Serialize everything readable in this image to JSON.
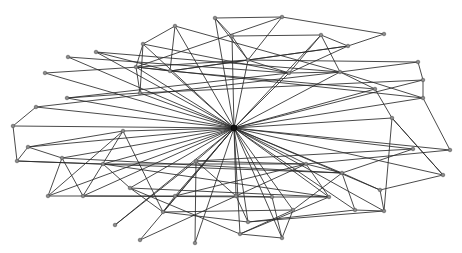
{
  "diagram": {
    "type": "network-graph",
    "background": "#ffffff",
    "edge_color": "#2a2a2a",
    "node_color": "#8a8a8a",
    "hub": "h",
    "nodes": [
      {
        "id": "h",
        "x": 234,
        "y": 128
      },
      {
        "id": "a1",
        "x": 215,
        "y": 18
      },
      {
        "id": "a2",
        "x": 282,
        "y": 17
      },
      {
        "id": "a3",
        "x": 175,
        "y": 26
      },
      {
        "id": "a4",
        "x": 143,
        "y": 44
      },
      {
        "id": "a5",
        "x": 232,
        "y": 36
      },
      {
        "id": "a6",
        "x": 321,
        "y": 35
      },
      {
        "id": "a7",
        "x": 384,
        "y": 34
      },
      {
        "id": "a8",
        "x": 348,
        "y": 46
      },
      {
        "id": "a9",
        "x": 96,
        "y": 52
      },
      {
        "id": "a10",
        "x": 68,
        "y": 57
      },
      {
        "id": "a11",
        "x": 45,
        "y": 73
      },
      {
        "id": "a12",
        "x": 136,
        "y": 67
      },
      {
        "id": "a13",
        "x": 170,
        "y": 71
      },
      {
        "id": "a14",
        "x": 140,
        "y": 93
      },
      {
        "id": "a15",
        "x": 67,
        "y": 98
      },
      {
        "id": "a16",
        "x": 36,
        "y": 107
      },
      {
        "id": "a17",
        "x": 248,
        "y": 60
      },
      {
        "id": "a18",
        "x": 289,
        "y": 73
      },
      {
        "id": "a19",
        "x": 340,
        "y": 72
      },
      {
        "id": "a20",
        "x": 418,
        "y": 62
      },
      {
        "id": "a21",
        "x": 423,
        "y": 80
      },
      {
        "id": "a22",
        "x": 423,
        "y": 98
      },
      {
        "id": "a23",
        "x": 375,
        "y": 89
      },
      {
        "id": "a24",
        "x": 392,
        "y": 118
      },
      {
        "id": "b1",
        "x": 13,
        "y": 126
      },
      {
        "id": "b2",
        "x": 123,
        "y": 131
      },
      {
        "id": "b3",
        "x": 28,
        "y": 147
      },
      {
        "id": "b4",
        "x": 17,
        "y": 161
      },
      {
        "id": "b5",
        "x": 62,
        "y": 158
      },
      {
        "id": "b6",
        "x": 103,
        "y": 164
      },
      {
        "id": "b7",
        "x": 48,
        "y": 196
      },
      {
        "id": "b8",
        "x": 83,
        "y": 196
      },
      {
        "id": "b9",
        "x": 130,
        "y": 188
      },
      {
        "id": "b10",
        "x": 163,
        "y": 212
      },
      {
        "id": "b11",
        "x": 115,
        "y": 225
      },
      {
        "id": "b12",
        "x": 140,
        "y": 240
      },
      {
        "id": "b13",
        "x": 195,
        "y": 243
      },
      {
        "id": "b14",
        "x": 196,
        "y": 161
      },
      {
        "id": "b15",
        "x": 306,
        "y": 164
      },
      {
        "id": "b16",
        "x": 342,
        "y": 173
      },
      {
        "id": "b17",
        "x": 380,
        "y": 190
      },
      {
        "id": "b18",
        "x": 384,
        "y": 211
      },
      {
        "id": "b19",
        "x": 443,
        "y": 175
      },
      {
        "id": "b20",
        "x": 450,
        "y": 150
      },
      {
        "id": "b21",
        "x": 413,
        "y": 149
      },
      {
        "id": "b22",
        "x": 329,
        "y": 197
      },
      {
        "id": "b23",
        "x": 272,
        "y": 197
      },
      {
        "id": "b24",
        "x": 236,
        "y": 196
      },
      {
        "id": "b25",
        "x": 293,
        "y": 210
      },
      {
        "id": "b26",
        "x": 248,
        "y": 222
      },
      {
        "id": "b27",
        "x": 282,
        "y": 238
      },
      {
        "id": "b28",
        "x": 240,
        "y": 234
      },
      {
        "id": "b29",
        "x": 355,
        "y": 210
      },
      {
        "id": "b30",
        "x": 175,
        "y": 196
      }
    ],
    "edges": [
      [
        "h",
        "a1"
      ],
      [
        "h",
        "a3"
      ],
      [
        "h",
        "a4"
      ],
      [
        "h",
        "a5"
      ],
      [
        "h",
        "a6"
      ],
      [
        "h",
        "a9"
      ],
      [
        "h",
        "a10"
      ],
      [
        "h",
        "a11"
      ],
      [
        "h",
        "a12"
      ],
      [
        "h",
        "a13"
      ],
      [
        "h",
        "a14"
      ],
      [
        "h",
        "a15"
      ],
      [
        "h",
        "a16"
      ],
      [
        "h",
        "a17"
      ],
      [
        "h",
        "a18"
      ],
      [
        "h",
        "a19"
      ],
      [
        "h",
        "a21"
      ],
      [
        "h",
        "a22"
      ],
      [
        "h",
        "a23"
      ],
      [
        "h",
        "a24"
      ],
      [
        "h",
        "b1"
      ],
      [
        "h",
        "b2"
      ],
      [
        "h",
        "b3"
      ],
      [
        "h",
        "b5"
      ],
      [
        "h",
        "b6"
      ],
      [
        "h",
        "b7"
      ],
      [
        "h",
        "b8"
      ],
      [
        "h",
        "b9"
      ],
      [
        "h",
        "b10"
      ],
      [
        "h",
        "b11"
      ],
      [
        "h",
        "b12"
      ],
      [
        "h",
        "b13"
      ],
      [
        "h",
        "b14"
      ],
      [
        "h",
        "b15"
      ],
      [
        "h",
        "b16"
      ],
      [
        "h",
        "b17"
      ],
      [
        "h",
        "b18"
      ],
      [
        "h",
        "b19"
      ],
      [
        "h",
        "b20"
      ],
      [
        "h",
        "b21"
      ],
      [
        "h",
        "b22"
      ],
      [
        "h",
        "b23"
      ],
      [
        "h",
        "b24"
      ],
      [
        "h",
        "b25"
      ],
      [
        "h",
        "b26"
      ],
      [
        "h",
        "b27"
      ],
      [
        "h",
        "b28"
      ],
      [
        "h",
        "b29"
      ],
      [
        "h",
        "b30"
      ],
      [
        "a1",
        "a2"
      ],
      [
        "a1",
        "a5"
      ],
      [
        "a1",
        "a17"
      ],
      [
        "a2",
        "a7"
      ],
      [
        "a2",
        "a17"
      ],
      [
        "a2",
        "a12"
      ],
      [
        "a3",
        "a4"
      ],
      [
        "a3",
        "a13"
      ],
      [
        "a3",
        "a19"
      ],
      [
        "a4",
        "a12"
      ],
      [
        "a4",
        "a18"
      ],
      [
        "a4",
        "a14"
      ],
      [
        "a5",
        "a6"
      ],
      [
        "a5",
        "a17"
      ],
      [
        "a6",
        "a8"
      ],
      [
        "a6",
        "a18"
      ],
      [
        "a6",
        "a19"
      ],
      [
        "a7",
        "a8"
      ],
      [
        "a8",
        "a18"
      ],
      [
        "a8",
        "a17"
      ],
      [
        "a8",
        "a13"
      ],
      [
        "a9",
        "a13"
      ],
      [
        "a9",
        "a19"
      ],
      [
        "a10",
        "a18"
      ],
      [
        "a11",
        "a17"
      ],
      [
        "a12",
        "a13"
      ],
      [
        "a12",
        "a14"
      ],
      [
        "a13",
        "a17"
      ],
      [
        "a14",
        "a15"
      ],
      [
        "a15",
        "a18"
      ],
      [
        "a16",
        "a19"
      ],
      [
        "a17",
        "a18"
      ],
      [
        "a18",
        "a19"
      ],
      [
        "a19",
        "a20"
      ],
      [
        "a19",
        "a23"
      ],
      [
        "a19",
        "a22"
      ],
      [
        "a20",
        "a21"
      ],
      [
        "a21",
        "a22"
      ],
      [
        "a20",
        "a17"
      ],
      [
        "a22",
        "a12"
      ],
      [
        "a23",
        "a24"
      ],
      [
        "a23",
        "a13"
      ],
      [
        "a24",
        "b18"
      ],
      [
        "a24",
        "b19"
      ],
      [
        "a21",
        "a14"
      ],
      [
        "b1",
        "b4"
      ],
      [
        "b1",
        "a16"
      ],
      [
        "b2",
        "b10"
      ],
      [
        "b2",
        "b7"
      ],
      [
        "b2",
        "b8"
      ],
      [
        "b2",
        "b3"
      ],
      [
        "b3",
        "b4"
      ],
      [
        "b3",
        "b5"
      ],
      [
        "b4",
        "b6"
      ],
      [
        "b4",
        "b16"
      ],
      [
        "b5",
        "b7"
      ],
      [
        "b5",
        "b8"
      ],
      [
        "b6",
        "b9"
      ],
      [
        "b6",
        "b15"
      ],
      [
        "b7",
        "b8"
      ],
      [
        "b8",
        "b24"
      ],
      [
        "b8",
        "b23"
      ],
      [
        "b9",
        "b10"
      ],
      [
        "b9",
        "b22"
      ],
      [
        "b10",
        "b25"
      ],
      [
        "b10",
        "b26"
      ],
      [
        "b11",
        "b14"
      ],
      [
        "b12",
        "b15"
      ],
      [
        "b13",
        "b14"
      ],
      [
        "b14",
        "b15"
      ],
      [
        "b14",
        "b24"
      ],
      [
        "b15",
        "b16"
      ],
      [
        "b15",
        "b22"
      ],
      [
        "b16",
        "b17"
      ],
      [
        "b16",
        "b21"
      ],
      [
        "b16",
        "b25"
      ],
      [
        "b17",
        "b18"
      ],
      [
        "b17",
        "b19"
      ],
      [
        "b18",
        "b29"
      ],
      [
        "b18",
        "b26"
      ],
      [
        "b19",
        "a24"
      ],
      [
        "b20",
        "a22"
      ],
      [
        "b20",
        "b15"
      ],
      [
        "b21",
        "b14"
      ],
      [
        "b22",
        "b23"
      ],
      [
        "b22",
        "b28"
      ],
      [
        "b23",
        "b24"
      ],
      [
        "b23",
        "b27"
      ],
      [
        "b24",
        "b26"
      ],
      [
        "b25",
        "b28"
      ],
      [
        "b25",
        "b27"
      ],
      [
        "b26",
        "b29"
      ],
      [
        "b27",
        "b28"
      ],
      [
        "b29",
        "b16"
      ],
      [
        "b30",
        "b15"
      ],
      [
        "b30",
        "b10"
      ],
      [
        "b28",
        "b9"
      ],
      [
        "b22",
        "b6"
      ],
      [
        "b16",
        "b5"
      ]
    ]
  }
}
